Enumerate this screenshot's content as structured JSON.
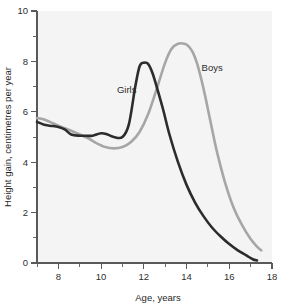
{
  "chart_data": {
    "type": "line",
    "title": "",
    "xlabel": "Age, years",
    "ylabel": "Height gain, centimetres per year",
    "xlim": [
      7,
      18
    ],
    "ylim": [
      0,
      10
    ],
    "grid": false,
    "legend_position": "inline-annotation",
    "x_ticks_major": [
      "8",
      "10",
      "12",
      "14",
      "16",
      "18"
    ],
    "x_ticks_major_values": [
      8,
      10,
      12,
      14,
      16,
      18
    ],
    "x_ticks_minor_values": [
      7,
      9,
      11,
      13,
      15,
      17
    ],
    "y_ticks_major": [
      "0",
      "2",
      "4",
      "6",
      "8",
      "10"
    ],
    "y_ticks_major_values": [
      0,
      2,
      4,
      6,
      8,
      10
    ],
    "y_ticks_minor_values": [
      1,
      3,
      5,
      7,
      9
    ],
    "series": [
      {
        "name": "Girls",
        "color": "#2c2c2c",
        "label_x": 11.2,
        "label_y": 6.75,
        "x": [
          7.0,
          7.3,
          7.6,
          8.0,
          8.3,
          8.6,
          9.0,
          9.3,
          9.6,
          10.0,
          10.3,
          10.6,
          11.0,
          11.3,
          11.6,
          11.8,
          12.0,
          12.2,
          12.4,
          12.6,
          12.9,
          13.2,
          13.6,
          14.0,
          14.4,
          14.8,
          15.2,
          15.6,
          16.0,
          16.4,
          16.8,
          17.1,
          17.3
        ],
        "y": [
          5.6,
          5.5,
          5.45,
          5.4,
          5.3,
          5.1,
          5.05,
          5.05,
          5.05,
          5.15,
          5.1,
          5.0,
          5.0,
          5.5,
          7.0,
          7.8,
          7.95,
          7.9,
          7.55,
          7.0,
          6.1,
          5.1,
          4.0,
          3.1,
          2.4,
          1.85,
          1.4,
          1.05,
          0.75,
          0.5,
          0.3,
          0.15,
          0.1
        ]
      },
      {
        "name": "Boys",
        "color": "#a6a6a6",
        "label_x": 15.2,
        "label_y": 7.6,
        "x": [
          7.0,
          7.3,
          7.6,
          8.0,
          8.3,
          8.6,
          9.0,
          9.4,
          9.8,
          10.2,
          10.6,
          11.0,
          11.4,
          11.8,
          12.2,
          12.6,
          13.0,
          13.3,
          13.6,
          13.9,
          14.1,
          14.3,
          14.5,
          14.8,
          15.1,
          15.4,
          15.8,
          16.2,
          16.6,
          17.0,
          17.3,
          17.5
        ],
        "y": [
          5.75,
          5.7,
          5.6,
          5.45,
          5.35,
          5.25,
          5.1,
          4.95,
          4.75,
          4.6,
          4.55,
          4.6,
          4.8,
          5.2,
          5.9,
          6.9,
          7.95,
          8.5,
          8.7,
          8.7,
          8.6,
          8.35,
          7.9,
          6.9,
          5.7,
          4.5,
          3.2,
          2.2,
          1.5,
          0.95,
          0.65,
          0.5
        ]
      }
    ]
  },
  "axes": {
    "x_title": "Age, years",
    "y_title": "Height gain, centimetres per year"
  },
  "annotations": {
    "girls_label": "Girls",
    "boys_label": "Boys"
  },
  "colors": {
    "girls_curve": "#2c2c2c",
    "boys_curve": "#a6a6a6",
    "axis": "#59595b",
    "plot_background": "#f4f4f4",
    "page_background": "#ffffff"
  }
}
